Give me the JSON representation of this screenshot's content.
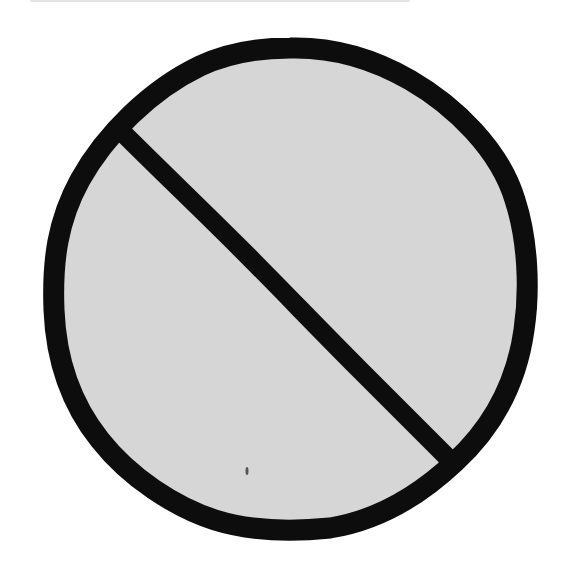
{
  "image": {
    "title": "Prohibition sign",
    "description": "Hand-drawn circle with a diagonal slash (no / prohibited symbol)",
    "icon": "prohibited-icon"
  },
  "colors": {
    "background": "#ffffff",
    "fill": "#d6d6d6",
    "stroke": "#0d0d0d",
    "speck": "#555555"
  },
  "shape": {
    "circle": {
      "cx": 290,
      "cy": 289,
      "rx": 236,
      "ry": 241,
      "stroke_width": 21
    },
    "slash": {
      "x1": 122,
      "y1": 132,
      "x2": 448,
      "y2": 458,
      "stroke_width": 19
    }
  }
}
